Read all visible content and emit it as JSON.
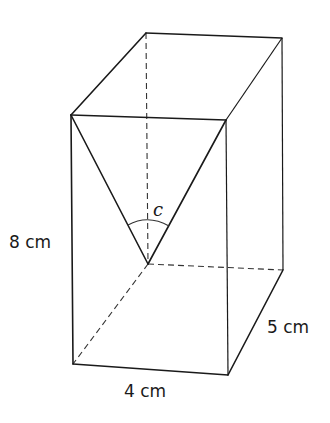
{
  "diagram": {
    "type": "cuboid-with-angle",
    "labels": {
      "height": "8 cm",
      "width": "4 cm",
      "depth": "5 cm",
      "angle": "c"
    },
    "vertices": {
      "top_front_left": [
        71,
        115
      ],
      "top_front_right": [
        226,
        120
      ],
      "top_back_left": [
        146,
        33
      ],
      "top_back_right": [
        282,
        38
      ],
      "bottom_front_left": [
        73,
        364
      ],
      "bottom_front_right": [
        228,
        375
      ],
      "bottom_back_left": [
        148,
        264
      ],
      "bottom_back_right": [
        283,
        270
      ]
    },
    "colors": {
      "line": "#1a1a1a",
      "background": "#ffffff"
    }
  }
}
